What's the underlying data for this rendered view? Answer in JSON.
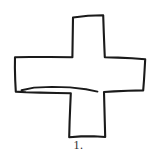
{
  "figure": {
    "caption": "1.",
    "background_color": "#ffffff",
    "ink_color": "#1a1a1a",
    "stroke_width": 2.1,
    "shape": {
      "type": "plus-cross-outline",
      "style": "hand-drawn freehand sketch, unclosed irregular strokes",
      "arms": 4,
      "arm_labels": [
        "top",
        "right",
        "bottom",
        "left"
      ],
      "note": "left arm drawn with a doubled/overshooting stroke along its lower edge"
    },
    "geometry": {
      "outline_points": [
        [
          73,
          17
        ],
        [
          103,
          15
        ],
        [
          104,
          41
        ],
        [
          105,
          57
        ],
        [
          123,
          58
        ],
        [
          145,
          59
        ],
        [
          144,
          74
        ],
        [
          143,
          90
        ],
        [
          122,
          91
        ],
        [
          104,
          92
        ],
        [
          105,
          114
        ],
        [
          105,
          137
        ],
        [
          86,
          136
        ],
        [
          69,
          137
        ],
        [
          70,
          115
        ],
        [
          71,
          93
        ],
        [
          45,
          93
        ],
        [
          16,
          92
        ],
        [
          15,
          75
        ],
        [
          15,
          57
        ],
        [
          44,
          57
        ],
        [
          72,
          57
        ]
      ],
      "stray_stroke_points": [
        [
          22,
          90
        ],
        [
          40,
          87
        ],
        [
          62,
          87
        ],
        [
          85,
          89
        ],
        [
          99,
          92
        ]
      ],
      "bounding_box": {
        "x": 15,
        "y": 15,
        "width": 130,
        "height": 122
      }
    }
  }
}
